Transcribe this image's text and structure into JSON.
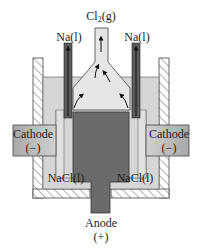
{
  "labels": {
    "chlorine": {
      "main": "Cl",
      "sub": "2",
      "suffix": "(g)"
    },
    "sodium_left": "Na(l)",
    "sodium_right": "Na(l)",
    "cathode_left": {
      "name": "Cathode",
      "sign": "(−)"
    },
    "cathode_right": {
      "name": "Cathode",
      "sign": "(−)"
    },
    "electrolyte_left": "NaCl(l)",
    "electrolyte_right": "NaCl(l)",
    "anode": {
      "name": "Anode",
      "sign": "(+)"
    }
  },
  "colors": {
    "background": "#ffffff",
    "liquid": "#d4d4d4",
    "funnel_gas": "#e4e4e4",
    "anode": "#6a6a6a",
    "cathode": "#b8b8b8",
    "na_tube": "#5a5a5a",
    "wall_hatch": "#555555",
    "outline": "#333333",
    "arrow": "#111111"
  }
}
